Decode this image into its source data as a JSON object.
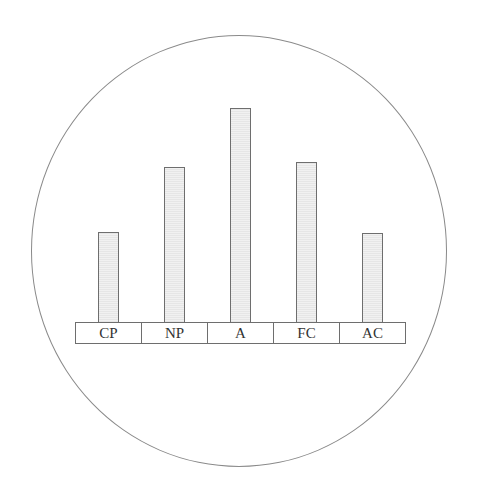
{
  "chart_data": {
    "type": "bar",
    "title": "",
    "xlabel": "",
    "ylabel": "",
    "categories": [
      "CP",
      "NP",
      "A",
      "FC",
      "AC"
    ],
    "values": [
      90,
      155,
      214,
      160,
      89
    ],
    "value_units": "relative height (px, no axis shown)",
    "grid": false,
    "legend": null,
    "enclosure": "circle"
  },
  "colors": {
    "bar_fill": "#ececec",
    "bar_stroke": "#6e6e6e",
    "circle_stroke": "#8a8a8a",
    "text": "#333333"
  }
}
